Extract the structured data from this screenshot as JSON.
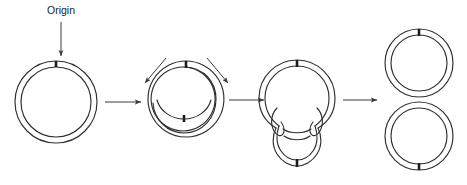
{
  "figure": {
    "title_label": "Origin",
    "background_color": "#ffffff",
    "line_color": "#2e2e2e",
    "tick_color": "#1d1d1d",
    "arrow_color": "#3a3a3a"
  },
  "annotations": [
    {
      "name": "origin-label",
      "text": "Origin",
      "x": 61,
      "y": 14
    }
  ],
  "stages": [
    {
      "id": "stage-1",
      "name": "unreplicated-circular-chromosome",
      "center_x": 56,
      "center_y": 102,
      "outer_radius": 41,
      "inner_radius": 35,
      "origin_tick": "top"
    },
    {
      "id": "stage-2",
      "name": "replication-bubble-initiation",
      "center_x": 186,
      "center_y": 100,
      "outer_radius": 38,
      "inner_radius": 32,
      "origin_tick": "top",
      "second_tick": "inner-bottom"
    },
    {
      "id": "stage-3",
      "name": "theta-intermediate-near-complete",
      "center_x": 297,
      "center_y": 98,
      "outer_radius": 38,
      "inner_radius": 32,
      "origin_tick": "top",
      "terminus_tick": "bottom"
    },
    {
      "id": "stage-4",
      "name": "two-separated-daughter-circles",
      "circles": [
        {
          "center_x": 419,
          "center_y": 63,
          "outer_radius": 34,
          "inner_radius": 28,
          "origin_tick": "top"
        },
        {
          "center_x": 419,
          "center_y": 135,
          "outer_radius": 34,
          "inner_radius": 28,
          "origin_tick": "bottom"
        }
      ]
    }
  ],
  "arrows": {
    "origin_pointer": {
      "name": "origin-pointer-arrow",
      "x1": 61,
      "y1": 22,
      "x2": 61,
      "y2": 57
    },
    "transitions": [
      {
        "name": "arrow-stage1-to-stage2",
        "x1": 105,
        "y1": 102,
        "x2": 143,
        "y2": 102
      },
      {
        "name": "arrow-stage2-to-stage3",
        "x1": 229,
        "y1": 100,
        "x2": 266,
        "y2": 100
      },
      {
        "name": "arrow-stage3-to-stage4",
        "x1": 343,
        "y1": 100,
        "x2": 379,
        "y2": 100
      }
    ],
    "fork_arrows": [
      {
        "name": "replication-fork-arrow-left",
        "x1": 164,
        "y1": 59,
        "x2": 144,
        "y2": 84
      },
      {
        "name": "replication-fork-arrow-right",
        "x1": 209,
        "y1": 59,
        "x2": 229,
        "y2": 84
      }
    ]
  }
}
